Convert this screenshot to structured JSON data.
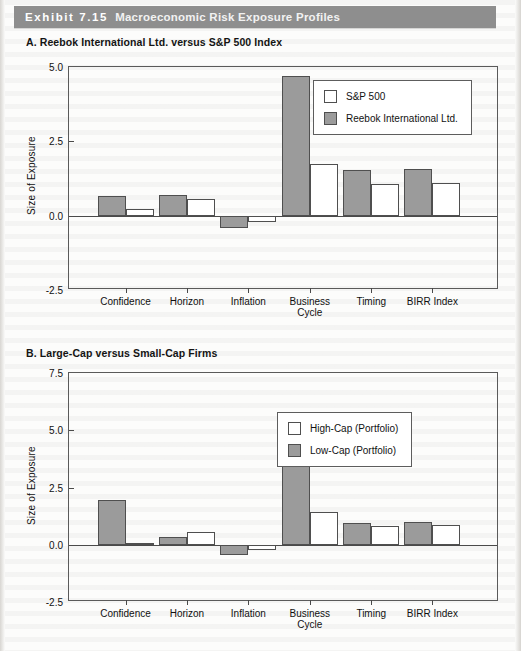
{
  "banner": {
    "exhibit_number": "Exhibit 7.15",
    "title": "Macroeconomic Risk Exposure Profiles",
    "background_color": "#8e8e8e",
    "text_color": "#ffffff"
  },
  "panels": {
    "a_caption": "A. Reebok International Ltd. versus S&P 500 Index",
    "b_caption": "B. Large-Cap versus Small-Cap Firms"
  },
  "colors": {
    "series_gray": "#9b9b9b",
    "series_white": "#ffffff",
    "axis": "#4a4a4a"
  },
  "chart_data": [
    {
      "id": "panel-a",
      "type": "bar",
      "title": "A. Reebok International Ltd. versus S&P 500 Index",
      "xlabel": "",
      "ylabel": "Size of Exposure",
      "ylim": [
        -2.5,
        5.0
      ],
      "yticks": [
        -2.5,
        0.0,
        2.5,
        5.0
      ],
      "ytick_labels": [
        "-2.5",
        "0.0",
        "2.5",
        "5.0"
      ],
      "grid": false,
      "legend_position": "upper right",
      "categories": [
        "Confidence",
        "Horizon",
        "Inflation",
        "Business Cycle",
        "Timing",
        "BIRR Index"
      ],
      "category_lines": [
        [
          "Confidence"
        ],
        [
          "Horizon"
        ],
        [
          "Inflation"
        ],
        [
          "Business",
          "Cycle"
        ],
        [
          "Timing"
        ],
        [
          "BIRR Index"
        ]
      ],
      "series": [
        {
          "name": "Reebok International Ltd.",
          "color": "#9b9b9b",
          "values": [
            0.67,
            0.7,
            -0.4,
            4.7,
            1.53,
            1.57
          ]
        },
        {
          "name": "S&P 500",
          "color": "#ffffff",
          "values": [
            0.23,
            0.55,
            -0.2,
            1.73,
            1.07,
            1.1
          ]
        }
      ],
      "legend_order": [
        "S&P 500",
        "Reebok International Ltd."
      ]
    },
    {
      "id": "panel-b",
      "type": "bar",
      "title": "B. Large-Cap versus Small-Cap Firms",
      "xlabel": "",
      "ylabel": "Size of Exposure",
      "ylim": [
        -2.5,
        7.5
      ],
      "yticks": [
        -2.5,
        0.0,
        2.5,
        5.0,
        7.5
      ],
      "ytick_labels": [
        "-2.5",
        "0.0",
        "2.5",
        "5.0",
        "7.5"
      ],
      "grid": false,
      "legend_position": "upper right",
      "categories": [
        "Confidence",
        "Horizon",
        "Inflation",
        "Business Cycle",
        "Timing",
        "BIRR Index"
      ],
      "category_lines": [
        [
          "Confidence"
        ],
        [
          "Horizon"
        ],
        [
          "Inflation"
        ],
        [
          "Business",
          "Cycle"
        ],
        [
          "Timing"
        ],
        [
          "BIRR Index"
        ]
      ],
      "series": [
        {
          "name": "Low-Cap (Portfolio)",
          "color": "#9b9b9b",
          "values": [
            1.95,
            0.35,
            -0.45,
            4.9,
            0.95,
            1.0
          ]
        },
        {
          "name": "High-Cap (Portfolio)",
          "color": "#ffffff",
          "values": [
            0.07,
            0.55,
            -0.25,
            1.45,
            0.82,
            0.85
          ]
        }
      ],
      "legend_order": [
        "High-Cap (Portfolio)",
        "Low-Cap (Portfolio)"
      ]
    }
  ]
}
